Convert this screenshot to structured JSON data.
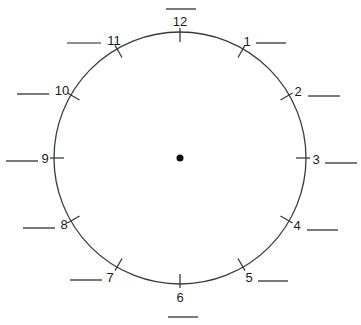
{
  "diagram": {
    "type": "clock-face-worksheet",
    "center": {
      "x": 180,
      "y": 158
    },
    "radius": 126,
    "stroke_color": "#3a3a3a",
    "center_dot_color": "#111111",
    "numbers": [
      {
        "label": "12",
        "x": 180,
        "y": 26,
        "anchor": "middle",
        "blank": {
          "x1": 166,
          "y1": 9,
          "x2": 196,
          "y2": 9
        }
      },
      {
        "label": "1",
        "x": 247,
        "y": 46,
        "anchor": "middle",
        "blank": {
          "x1": 256,
          "y1": 43,
          "x2": 286,
          "y2": 43
        }
      },
      {
        "label": "2",
        "x": 298,
        "y": 96,
        "anchor": "middle",
        "blank": {
          "x1": 308,
          "y1": 96,
          "x2": 340,
          "y2": 96
        }
      },
      {
        "label": "3",
        "x": 316,
        "y": 164,
        "anchor": "middle",
        "blank": {
          "x1": 325,
          "y1": 163,
          "x2": 357,
          "y2": 163
        }
      },
      {
        "label": "4",
        "x": 297,
        "y": 230,
        "anchor": "middle",
        "blank": {
          "x1": 307,
          "y1": 230,
          "x2": 338,
          "y2": 230
        }
      },
      {
        "label": "5",
        "x": 249,
        "y": 282,
        "anchor": "middle",
        "blank": {
          "x1": 258,
          "y1": 281,
          "x2": 288,
          "y2": 281
        }
      },
      {
        "label": "6",
        "x": 180,
        "y": 302,
        "anchor": "middle",
        "blank": {
          "x1": 168,
          "y1": 317,
          "x2": 198,
          "y2": 317
        }
      },
      {
        "label": "7",
        "x": 110,
        "y": 282,
        "anchor": "middle",
        "blank": {
          "x1": 70,
          "y1": 280,
          "x2": 102,
          "y2": 280
        }
      },
      {
        "label": "8",
        "x": 64,
        "y": 229,
        "anchor": "middle",
        "blank": {
          "x1": 23,
          "y1": 228,
          "x2": 55,
          "y2": 228
        }
      },
      {
        "label": "9",
        "x": 45,
        "y": 163,
        "anchor": "middle",
        "blank": {
          "x1": 6,
          "y1": 161,
          "x2": 38,
          "y2": 161
        }
      },
      {
        "label": "10",
        "x": 62,
        "y": 95,
        "anchor": "middle",
        "blank": {
          "x1": 17,
          "y1": 94,
          "x2": 49,
          "y2": 94
        }
      },
      {
        "label": "11",
        "x": 114,
        "y": 45,
        "anchor": "middle",
        "blank": {
          "x1": 67,
          "y1": 43,
          "x2": 101,
          "y2": 43
        }
      }
    ]
  }
}
